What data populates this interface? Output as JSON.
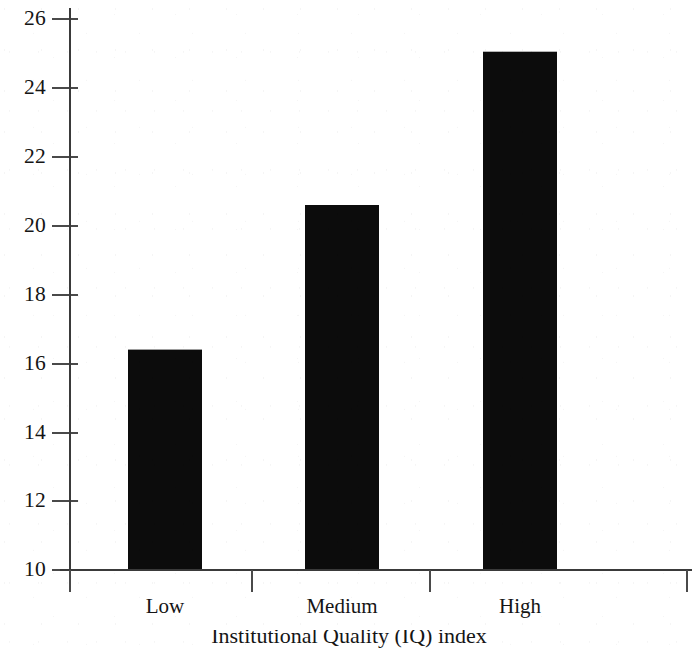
{
  "chart_data": {
    "type": "bar",
    "title": "",
    "xlabel": "Institutional Quality (IQ) index",
    "ylabel": "",
    "categories": [
      "Low",
      "Medium",
      "High"
    ],
    "values": [
      16.4,
      20.6,
      25.05
    ],
    "series": [
      {
        "name": "",
        "values": [
          16.4,
          20.6,
          25.05
        ]
      }
    ],
    "ylim": [
      10,
      26
    ],
    "yticks": [
      10,
      12,
      14,
      16,
      18,
      20,
      22,
      24,
      26
    ],
    "ytick_labels": [
      "10",
      "12",
      "14",
      "16",
      "18",
      "20",
      "22",
      "24",
      "26"
    ],
    "xtick_labels": [
      "Low",
      "Medium",
      "High"
    ],
    "grid": false,
    "legend": null,
    "legend_position": "none",
    "bar_color": "#0c0c0c",
    "axis_color": "#3a3a3a",
    "annotations": []
  },
  "axis": {
    "y_tick_values": [
      "26",
      "24",
      "22",
      "20",
      "18",
      "16",
      "14",
      "12",
      "10"
    ],
    "x_categories": [
      "Low",
      "Medium",
      "High"
    ],
    "x_axis_title": "Institutional Quality (IQ) index"
  }
}
